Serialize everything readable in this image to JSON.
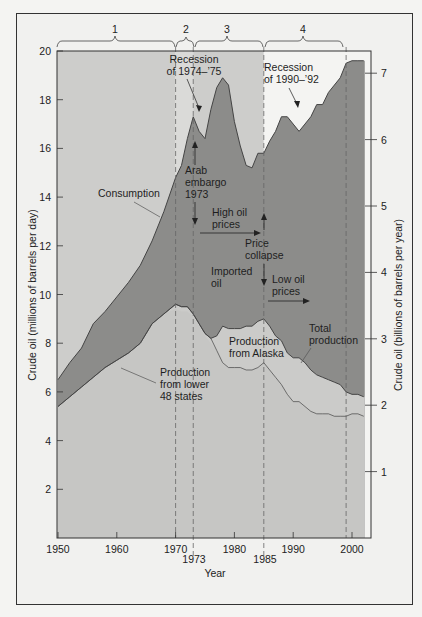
{
  "chart_data": {
    "type": "area",
    "title": "",
    "xlabel": "Year",
    "ylabel": "Crude oil (millions of barrels per day)",
    "ylabel_right": "Crude oil (billions of barrels per year)",
    "xlim": [
      1950,
      2003
    ],
    "ylim": [
      0,
      20
    ],
    "ylim_right": [
      0,
      8
    ],
    "x_ticks": [
      1950,
      1960,
      1970,
      1980,
      1990,
      2000
    ],
    "x_extra_ticks": [
      1973,
      1985
    ],
    "y_ticks": [
      2,
      4,
      6,
      8,
      10,
      12,
      14,
      16,
      18,
      20
    ],
    "y_right_ticks": [
      1,
      2,
      3,
      4,
      5,
      6,
      7
    ],
    "grid": false,
    "eras": [
      {
        "label": "1",
        "start": 1950,
        "end": 1970
      },
      {
        "label": "2",
        "start": 1970,
        "end": 1973
      },
      {
        "label": "3",
        "start": 1973,
        "end": 1985
      },
      {
        "label": "4",
        "start": 1985,
        "end": 1999
      }
    ],
    "dashed_lines": [
      1970,
      1973,
      1985,
      1999
    ],
    "x": [
      1950,
      1952,
      1954,
      1956,
      1958,
      1960,
      1962,
      1964,
      1966,
      1968,
      1970,
      1971,
      1972,
      1973,
      1974,
      1975,
      1976,
      1977,
      1978,
      1979,
      1980,
      1981,
      1982,
      1983,
      1984,
      1985,
      1986,
      1987,
      1988,
      1989,
      1990,
      1991,
      1992,
      1993,
      1994,
      1995,
      1996,
      1997,
      1998,
      1999,
      2000,
      2001,
      2002
    ],
    "series": [
      {
        "name": "Consumption",
        "values": [
          6.5,
          7.2,
          7.8,
          8.8,
          9.3,
          9.9,
          10.5,
          11.2,
          12.2,
          13.4,
          14.8,
          15.3,
          16.4,
          17.3,
          16.7,
          16.4,
          17.6,
          18.5,
          18.9,
          18.6,
          17.1,
          16.1,
          15.3,
          15.2,
          15.8,
          15.8,
          16.3,
          16.7,
          17.3,
          17.3,
          17.0,
          16.7,
          17.0,
          17.3,
          17.8,
          17.8,
          18.3,
          18.6,
          18.9,
          19.5,
          19.6,
          19.6,
          19.6
        ]
      },
      {
        "name": "Total production",
        "values": [
          5.4,
          5.8,
          6.2,
          6.6,
          7.0,
          7.3,
          7.6,
          8.0,
          8.8,
          9.2,
          9.6,
          9.5,
          9.5,
          9.2,
          8.8,
          8.4,
          8.2,
          8.3,
          8.7,
          8.6,
          8.6,
          8.6,
          8.7,
          8.7,
          8.9,
          9.0,
          8.7,
          8.3,
          8.1,
          7.6,
          7.4,
          7.4,
          7.2,
          6.9,
          6.7,
          6.6,
          6.5,
          6.4,
          6.3,
          6.0,
          5.9,
          5.9,
          5.8
        ]
      },
      {
        "name": "Production from lower 48 states",
        "values": [
          5.4,
          5.8,
          6.2,
          6.6,
          7.0,
          7.3,
          7.6,
          8.0,
          8.8,
          9.2,
          9.4,
          9.3,
          9.3,
          9.1,
          8.7,
          8.3,
          8.0,
          7.7,
          7.2,
          7.0,
          7.0,
          7.0,
          6.9,
          6.9,
          7.0,
          7.2,
          6.9,
          6.6,
          6.3,
          5.9,
          5.6,
          5.6,
          5.4,
          5.2,
          5.1,
          5.1,
          5.1,
          5.0,
          5.0,
          5.0,
          5.1,
          5.1,
          5.0
        ]
      }
    ],
    "regions": [
      {
        "name": "Imported oil",
        "between": [
          "Total production",
          "Consumption"
        ]
      },
      {
        "name": "Production from Alaska",
        "between": [
          "Production from lower 48 states",
          "Total production"
        ]
      },
      {
        "name": "Production from lower 48 states",
        "between": [
          0,
          "Production from lower 48 states"
        ]
      }
    ],
    "annotations": [
      {
        "text": [
          "Recession",
          "of 1974–’75"
        ],
        "points_to": 1974
      },
      {
        "text": [
          "Recession",
          "of 1990–’92"
        ],
        "points_to": 1991
      },
      {
        "text": [
          "Arab",
          "embargo",
          "1973"
        ],
        "at": 1973
      },
      {
        "text": [
          "High oil",
          "prices"
        ],
        "span": [
          1973,
          1985
        ]
      },
      {
        "text": [
          "Price",
          "collapse"
        ],
        "at": 1985
      },
      {
        "text": [
          "Low oil",
          "prices"
        ],
        "span": [
          1985,
          1993
        ]
      },
      {
        "text": [
          "Imported",
          "oil"
        ]
      },
      {
        "text": [
          "Consumption"
        ]
      },
      {
        "text": [
          "Production",
          "from  Alaska"
        ]
      },
      {
        "text": [
          "Total",
          "production"
        ]
      },
      {
        "text": [
          "Production",
          "from lower",
          "48 states"
        ]
      }
    ]
  },
  "labels": {
    "era1": "1",
    "era2": "2",
    "era3": "3",
    "era4": "4",
    "xlabel": "Year",
    "ylabel": "Crude oil (millions of barrels per day)",
    "ylabel_right": "Crude oil (billions of barrels per year)",
    "rec74_1": "Recession",
    "rec74_2": "of 1974–’75",
    "rec90_1": "Recession",
    "rec90_2": "of 1990–’92",
    "arab_1": "Arab",
    "arab_2": "embargo",
    "arab_3": "1973",
    "high_1": "High oil",
    "high_2": "prices",
    "collapse_1": "Price",
    "collapse_2": "collapse",
    "low_1": "Low oil",
    "low_2": "prices",
    "imported_1": "Imported",
    "imported_2": "oil",
    "consumption": "Consumption",
    "alaska_1": "Production",
    "alaska_2": "from  Alaska",
    "total_1": "Total",
    "total_2": "production",
    "lower48_1": "Production",
    "lower48_2": "from lower",
    "lower48_3": "48 states",
    "x1973": "1973",
    "x1985": "1985"
  },
  "colors": {
    "era_bg": "#cdcdcb",
    "era2_bg": "#dadad8",
    "era4_bg": "#f4f4f2",
    "imported": "#8c8c8a",
    "alaska": "#cbcbc9",
    "lower48": "#c6c6c4",
    "line": "#444444"
  }
}
